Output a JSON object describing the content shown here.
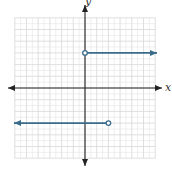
{
  "chart_data": {
    "type": "line",
    "title": "",
    "xlabel": "x",
    "ylabel": "y",
    "xlim": [
      -6,
      6
    ],
    "ylim": [
      -6,
      6
    ],
    "grid": true,
    "series": [
      {
        "name": "upper-ray",
        "x": [
          0,
          6
        ],
        "y": [
          3,
          3
        ],
        "start": {
          "x": 0,
          "y": 3,
          "marker": "open-circle"
        },
        "end": {
          "direction": "right",
          "marker": "arrow"
        },
        "color": "#3a6b8a"
      },
      {
        "name": "lower-ray",
        "x": [
          -6,
          2
        ],
        "y": [
          -3,
          -3
        ],
        "start": {
          "direction": "left",
          "marker": "arrow"
        },
        "end": {
          "x": 2,
          "y": -3,
          "marker": "open-circle"
        },
        "color": "#3a6b8a"
      }
    ]
  },
  "labels": {
    "x_axis": "x",
    "y_axis": "y"
  },
  "colors": {
    "grid": "#d8d8d8",
    "axis": "#222222",
    "ray": "#3a6b8a"
  },
  "layout": {
    "origin_px": [
      85,
      88
    ],
    "unit_px": 11.7
  }
}
